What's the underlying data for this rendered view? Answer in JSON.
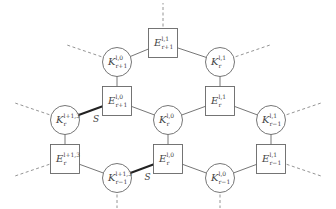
{
  "diagram": {
    "type": "honeycomb-graph",
    "nodes": [
      {
        "id": "E_r+1_l_1",
        "shape": "square",
        "letter": "E",
        "sup": "l,1",
        "sub": "r+1",
        "x": 163,
        "y": 43
      },
      {
        "id": "K_r+1_l_0",
        "shape": "circle",
        "letter": "K",
        "sup": "l,0",
        "sub": "r+1",
        "x": 117,
        "y": 62
      },
      {
        "id": "K_r_l_1",
        "shape": "circle",
        "letter": "K",
        "sup": "l,1",
        "sub": "r",
        "x": 220,
        "y": 62
      },
      {
        "id": "E_r+1_l_0",
        "shape": "square",
        "letter": "E",
        "sup": "l,0",
        "sub": "r+1",
        "x": 117,
        "y": 101
      },
      {
        "id": "E_r_l_1",
        "shape": "square",
        "letter": "E",
        "sup": "l,1",
        "sub": "r",
        "x": 220,
        "y": 101
      },
      {
        "id": "K_r_l+1_3",
        "shape": "circle",
        "letter": "K",
        "sup": "l+1,3",
        "sub": "r",
        "x": 65,
        "y": 120
      },
      {
        "id": "K_r_l_0",
        "shape": "circle",
        "letter": "K",
        "sup": "l,0",
        "sub": "r",
        "x": 168,
        "y": 120
      },
      {
        "id": "K_r-1_l_1",
        "shape": "circle",
        "letter": "K",
        "sup": "l,1",
        "sub": "r−1",
        "x": 271,
        "y": 120
      },
      {
        "id": "E_r_l+1_3",
        "shape": "square",
        "letter": "E",
        "sup": "l+1,3",
        "sub": "r",
        "x": 65,
        "y": 159
      },
      {
        "id": "E_r_l_0",
        "shape": "square",
        "letter": "E",
        "sup": "l,0",
        "sub": "r",
        "x": 168,
        "y": 159
      },
      {
        "id": "E_r-1_l_1",
        "shape": "square",
        "letter": "E",
        "sup": "l,1",
        "sub": "r−1",
        "x": 271,
        "y": 159
      },
      {
        "id": "K_r-1_l+1_3",
        "shape": "circle",
        "letter": "K",
        "sup": "l+1,3",
        "sub": "r−1",
        "x": 117,
        "y": 178
      },
      {
        "id": "K_r-1_l_0",
        "shape": "circle",
        "letter": "K",
        "sup": "l,0",
        "sub": "r−1",
        "x": 220,
        "y": 178
      }
    ],
    "edges": [
      {
        "from": "E_r+1_l_1",
        "to": "K_r+1_l_0",
        "style": "solid"
      },
      {
        "from": "E_r+1_l_1",
        "to": "K_r_l_1",
        "style": "solid"
      },
      {
        "from": "K_r+1_l_0",
        "to": "E_r+1_l_0",
        "style": "solid"
      },
      {
        "from": "K_r_l_1",
        "to": "E_r_l_1",
        "style": "solid"
      },
      {
        "from": "E_r+1_l_0",
        "to": "K_r_l+1_3",
        "style": "bold",
        "label": "S"
      },
      {
        "from": "E_r+1_l_0",
        "to": "K_r_l_0",
        "style": "solid"
      },
      {
        "from": "E_r_l_1",
        "to": "K_r_l_0",
        "style": "solid"
      },
      {
        "from": "E_r_l_1",
        "to": "K_r-1_l_1",
        "style": "solid"
      },
      {
        "from": "K_r_l+1_3",
        "to": "E_r_l+1_3",
        "style": "solid"
      },
      {
        "from": "K_r_l_0",
        "to": "E_r_l_0",
        "style": "solid"
      },
      {
        "from": "K_r-1_l_1",
        "to": "E_r-1_l_1",
        "style": "solid"
      },
      {
        "from": "E_r_l+1_3",
        "to": "K_r-1_l+1_3",
        "style": "solid"
      },
      {
        "from": "E_r_l_0",
        "to": "K_r-1_l+1_3",
        "style": "bold",
        "label": "S"
      },
      {
        "from": "E_r_l_0",
        "to": "K_r-1_l_0",
        "style": "solid"
      },
      {
        "from": "E_r-1_l_1",
        "to": "K_r-1_l_0",
        "style": "solid"
      }
    ],
    "dangling_edges": [
      {
        "from": "E_r+1_l_1",
        "dx": 0,
        "dy": -40
      },
      {
        "from": "K_r+1_l_0",
        "dx": -50,
        "dy": -17
      },
      {
        "from": "K_r_l_1",
        "dx": 50,
        "dy": -17
      },
      {
        "from": "K_r_l+1_3",
        "dx": -50,
        "dy": -17
      },
      {
        "from": "K_r-1_l_1",
        "dx": 50,
        "dy": -17
      },
      {
        "from": "E_r_l+1_3",
        "dx": -50,
        "dy": 17
      },
      {
        "from": "E_r-1_l_1",
        "dx": 50,
        "dy": 17
      },
      {
        "from": "K_r-1_l+1_3",
        "dx": 0,
        "dy": 30
      },
      {
        "from": "K_r-1_l_0",
        "dx": 0,
        "dy": 30
      }
    ],
    "edge_labels": [
      "S",
      "S"
    ]
  }
}
